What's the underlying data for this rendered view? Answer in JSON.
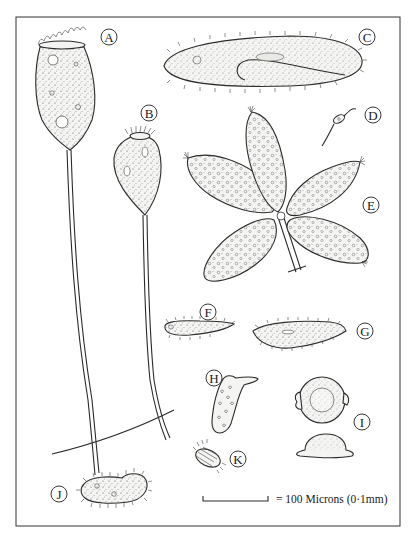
{
  "figure": {
    "type": "scientific-illustration",
    "labels": [
      "A",
      "B",
      "C",
      "D",
      "E",
      "F",
      "G",
      "H",
      "I",
      "J",
      "K"
    ],
    "specimens": [
      {
        "id": "A",
        "label": "A",
        "description": "Large stalked vase-shaped ciliate with ciliated peristome crown and long stalk"
      },
      {
        "id": "B",
        "label": "B",
        "description": "Smaller stalked pear-shaped ciliate with ciliary crown and long stalk"
      },
      {
        "id": "C",
        "label": "C",
        "description": "Large elongated elliptical ciliate covered in cilia with oral groove"
      },
      {
        "id": "D",
        "label": "D",
        "description": "Tiny flagellate with long flagellum"
      },
      {
        "id": "E",
        "label": "E",
        "description": "Colony of five leaf-shaped ciliates on branching stalk"
      },
      {
        "id": "F",
        "label": "F",
        "description": "Small elongated ciliated form"
      },
      {
        "id": "G",
        "label": "G",
        "description": "Spindle-shaped ciliated form with nucleus"
      },
      {
        "id": "H",
        "label": "H",
        "description": "Irregular amoeboid shape"
      },
      {
        "id": "I",
        "label": "I",
        "description": "Circular disc-shaped organism shown from top and side views"
      },
      {
        "id": "J",
        "label": "J",
        "description": "Kidney-shaped ciliate covered in cilia"
      },
      {
        "id": "K",
        "label": "K",
        "description": "Small oval striated ciliate"
      }
    ],
    "scale_bar": {
      "text": "= 100 Microns (0·1mm)"
    }
  }
}
